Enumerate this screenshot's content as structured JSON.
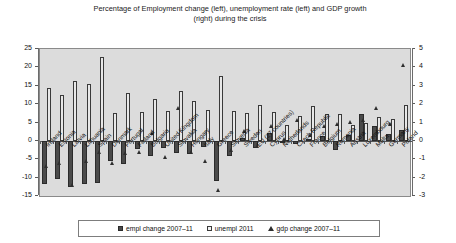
{
  "chart_data": {
    "type": "bar",
    "title": "Percentage of Employment change (left), unemployment rate (left) and GDP growth (right) during the crisis",
    "title_line1": "Percentage of Employment change (left), unemployment rate (left) and GDP growth",
    "title_line2": "(right) during the crisis",
    "xlabel": "",
    "ylabel": "",
    "ylim": [
      -15,
      25
    ],
    "ylim_right": [
      -3,
      5
    ],
    "yticks": [
      25,
      20,
      15,
      10,
      5,
      0,
      -5,
      -10,
      -15
    ],
    "yticks_right": [
      5,
      4,
      3,
      2,
      1,
      0,
      -1,
      -2,
      -3
    ],
    "grid": false,
    "legend_position": "bottom",
    "categories": [
      "Ireland",
      "Estonia",
      "Latvia",
      "Lithuania",
      "Spain",
      "Denmark",
      "Portugal",
      "Finland",
      "Bulgaria",
      "United Kingdom",
      "Slovakia",
      "Hungary",
      "Italy",
      "Greece",
      "Slovenia",
      "Sweden",
      "EU (27 countries)",
      "Cyprus",
      "Netherlands",
      "Czech Republic",
      "France",
      "Belgium",
      "Romania",
      "Austria",
      "Luxembourg",
      "Malta",
      "Germany",
      "Poland"
    ],
    "series": [
      {
        "name": "empl change 2007-11",
        "axis": "left",
        "marker": "filled-square",
        "values": [
          -11.6,
          -10.5,
          -12.6,
          -11.8,
          -11.4,
          -5.6,
          -6.3,
          -2.1,
          -4.1,
          -1.9,
          -3.4,
          -3.5,
          -1.6,
          -11.0,
          -4.2,
          0.7,
          -1.9,
          2.1,
          -0.5,
          -0.8,
          0.4,
          1.3,
          -2.6,
          1.6,
          7.2,
          4.1,
          1.8,
          2.9
        ]
      },
      {
        "name": "unempl 2011",
        "axis": "left",
        "marker": "open-square",
        "values": [
          14.4,
          12.5,
          16.2,
          15.4,
          22.9,
          7.6,
          12.9,
          7.8,
          11.3,
          8.0,
          13.5,
          10.9,
          8.4,
          17.7,
          8.2,
          7.5,
          9.7,
          7.9,
          4.4,
          6.7,
          9.6,
          7.2,
          7.4,
          4.2,
          4.8,
          6.5,
          5.9,
          9.7
        ]
      },
      {
        "name": "gdp change 2007-11",
        "axis": "right",
        "marker": "triangle",
        "values": [
          -1.4,
          -1.2,
          -2.4,
          -1.1,
          -0.6,
          -1.2,
          -0.7,
          -0.6,
          0.4,
          -0.9,
          1.8,
          -0.6,
          -1.1,
          -2.7,
          -0.5,
          0.5,
          -0.3,
          0.8,
          0.1,
          1.1,
          0.3,
          0.8,
          0.9,
          1.0,
          1.1,
          1.8,
          0.9,
          4.1
        ]
      }
    ],
    "legend": [
      "empl change 2007–11",
      "unempl 2011",
      "gdp change 2007–11"
    ]
  }
}
